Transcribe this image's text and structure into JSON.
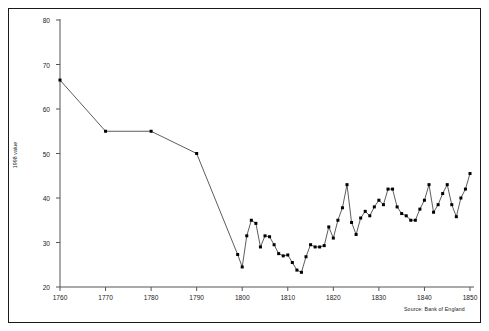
{
  "chart_data": {
    "type": "line",
    "title": "",
    "subtitle": "",
    "xlabel": "",
    "ylabel": "1998 value",
    "xlim": [
      1760,
      1850
    ],
    "ylim": [
      20,
      80
    ],
    "xticks": [
      1760,
      1770,
      1780,
      1790,
      1800,
      1810,
      1820,
      1830,
      1840,
      1850
    ],
    "yticks": [
      20,
      30,
      40,
      50,
      60,
      70,
      80
    ],
    "grid": false,
    "legend": null,
    "marker": "filled-square",
    "line_color": "#333333",
    "marker_color": "#000000",
    "annotation": "Source: Bank of England",
    "series": [
      {
        "name": "1998 value",
        "x": [
          1760,
          1770,
          1780,
          1790,
          1799,
          1800,
          1801,
          1802,
          1803,
          1804,
          1805,
          1806,
          1807,
          1808,
          1809,
          1810,
          1811,
          1812,
          1813,
          1814,
          1815,
          1816,
          1817,
          1818,
          1819,
          1820,
          1821,
          1822,
          1823,
          1824,
          1825,
          1826,
          1827,
          1828,
          1829,
          1830,
          1831,
          1832,
          1833,
          1834,
          1835,
          1836,
          1837,
          1838,
          1839,
          1840,
          1841,
          1842,
          1843,
          1844,
          1845,
          1846,
          1847,
          1848,
          1849,
          1850
        ],
        "values": [
          66.5,
          55.0,
          55.0,
          50.0,
          27.3,
          24.5,
          31.5,
          35.0,
          34.3,
          29.0,
          31.5,
          31.3,
          29.5,
          27.5,
          27.0,
          27.2,
          25.5,
          23.8,
          23.3,
          26.8,
          29.5,
          29.0,
          29.0,
          29.3,
          33.5,
          31.0,
          35.0,
          37.8,
          43.0,
          34.5,
          31.8,
          35.5,
          37.0,
          36.0,
          38.0,
          39.5,
          38.5,
          42.0,
          42.0,
          38.0,
          36.5,
          36.0,
          35.0,
          35.0,
          37.5,
          39.5,
          43.0,
          36.8,
          38.5,
          41.0,
          43.0,
          38.5,
          35.8,
          40.0,
          42.0,
          45.5
        ]
      }
    ]
  },
  "axis": {
    "ylabel": "1998 value"
  },
  "footer": {
    "source": "Source: Bank of England"
  }
}
